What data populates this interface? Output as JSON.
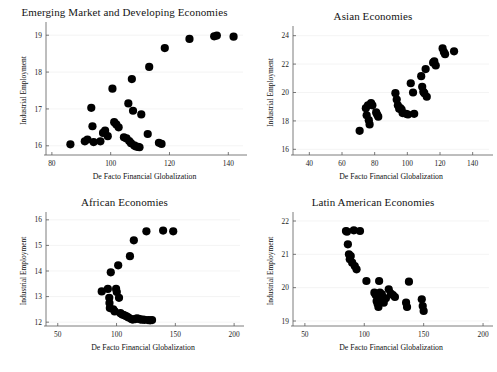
{
  "figure": {
    "background_color": "#ffffff",
    "marker_color": "#000000",
    "axis_color": "#5a5a5a",
    "panel_count": 4
  },
  "chart_data": [
    {
      "type": "scatter",
      "title": "Emerging Market and Developing Economies",
      "xlabel": "De Facto Financial Globalization",
      "ylabel": "Industrial Employment",
      "xlim": [
        78,
        145
      ],
      "ylim": [
        15.75,
        19.25
      ],
      "xticks": [
        80,
        100,
        120,
        140
      ],
      "yticks": [
        16,
        17,
        18,
        19
      ],
      "grid": false,
      "legend": "none",
      "points": [
        [
          86.3,
          16.04
        ],
        [
          91.2,
          16.12
        ],
        [
          92.1,
          16.17
        ],
        [
          93.4,
          17.03
        ],
        [
          93.8,
          16.53
        ],
        [
          94.2,
          16.1
        ],
        [
          96.5,
          16.12
        ],
        [
          97.4,
          16.35
        ],
        [
          98.1,
          16.41
        ],
        [
          99.0,
          16.26
        ],
        [
          100.6,
          17.55
        ],
        [
          101.2,
          16.64
        ],
        [
          101.9,
          16.58
        ],
        [
          102.7,
          16.5
        ],
        [
          104.5,
          16.23
        ],
        [
          105.4,
          16.2
        ],
        [
          106.0,
          17.15
        ],
        [
          106.3,
          16.13
        ],
        [
          106.9,
          16.07
        ],
        [
          107.2,
          17.81
        ],
        [
          107.6,
          16.95
        ],
        [
          108.0,
          16.01
        ],
        [
          108.6,
          15.98
        ],
        [
          109.3,
          15.97
        ],
        [
          109.8,
          15.96
        ],
        [
          110.4,
          16.85
        ],
        [
          112.6,
          16.32
        ],
        [
          113.1,
          18.14
        ],
        [
          116.4,
          16.08
        ],
        [
          117.3,
          16.05
        ],
        [
          118.4,
          18.65
        ],
        [
          126.8,
          18.9
        ],
        [
          135.2,
          18.97
        ],
        [
          136.1,
          18.99
        ],
        [
          141.8,
          18.96
        ]
      ]
    },
    {
      "type": "scatter",
      "title": "Asian Economies",
      "xlabel": "De Facto Financial Globalization",
      "ylabel": "Industrial Employment",
      "xlim": [
        30,
        150
      ],
      "ylim": [
        15.6,
        24.4
      ],
      "xticks": [
        40,
        60,
        80,
        100,
        120,
        140
      ],
      "yticks": [
        16,
        18,
        20,
        22,
        24
      ],
      "grid": false,
      "legend": "none",
      "points": [
        [
          70.8,
          17.3
        ],
        [
          74.6,
          18.9
        ],
        [
          75.1,
          18.4
        ],
        [
          75.9,
          19.1
        ],
        [
          76.4,
          18.05
        ],
        [
          76.9,
          17.75
        ],
        [
          77.8,
          19.25
        ],
        [
          78.6,
          19.1
        ],
        [
          80.9,
          18.6
        ],
        [
          81.5,
          18.45
        ],
        [
          82.2,
          18.3
        ],
        [
          92.7,
          19.95
        ],
        [
          93.5,
          19.5
        ],
        [
          94.2,
          19.1
        ],
        [
          95.0,
          18.85
        ],
        [
          95.7,
          18.9
        ],
        [
          96.5,
          18.8
        ],
        [
          97.1,
          18.55
        ],
        [
          99.2,
          18.5
        ],
        [
          100.4,
          18.45
        ],
        [
          102.1,
          20.65
        ],
        [
          103.5,
          20.0
        ],
        [
          104.2,
          18.5
        ],
        [
          108.5,
          21.15
        ],
        [
          109.1,
          20.4
        ],
        [
          109.8,
          20.05
        ],
        [
          110.4,
          19.95
        ],
        [
          111.2,
          21.65
        ],
        [
          111.9,
          19.7
        ],
        [
          115.8,
          22.1
        ],
        [
          116.5,
          22.2
        ],
        [
          117.4,
          21.9
        ],
        [
          121.6,
          23.1
        ],
        [
          122.4,
          22.85
        ],
        [
          123.1,
          22.7
        ],
        [
          128.6,
          22.9
        ]
      ]
    },
    {
      "type": "scatter",
      "title": "African Economies",
      "xlabel": "De Facto Financial Globalization",
      "ylabel": "Industrial Employment",
      "xlim": [
        40,
        205
      ],
      "ylim": [
        11.85,
        16.15
      ],
      "xticks": [
        50,
        100,
        150,
        200
      ],
      "yticks": [
        12,
        13,
        14,
        15,
        16
      ],
      "grid": false,
      "legend": "none",
      "points": [
        [
          87.4,
          13.2
        ],
        [
          92.6,
          13.3
        ],
        [
          93.8,
          12.95
        ],
        [
          94.0,
          12.75
        ],
        [
          94.3,
          12.55
        ],
        [
          95.1,
          13.95
        ],
        [
          97.2,
          12.5
        ],
        [
          98.4,
          12.42
        ],
        [
          99.6,
          13.3
        ],
        [
          100.2,
          13.18
        ],
        [
          101.4,
          14.22
        ],
        [
          102.1,
          12.95
        ],
        [
          103.3,
          12.35
        ],
        [
          104.8,
          12.3
        ],
        [
          106.2,
          12.28
        ],
        [
          107.5,
          12.25
        ],
        [
          108.8,
          12.22
        ],
        [
          110.2,
          12.18
        ],
        [
          111.4,
          14.58
        ],
        [
          112.6,
          12.12
        ],
        [
          113.8,
          12.1
        ],
        [
          114.7,
          15.2
        ],
        [
          116.0,
          12.12
        ],
        [
          117.3,
          12.15
        ],
        [
          118.9,
          12.13
        ],
        [
          120.5,
          12.1
        ],
        [
          122.2,
          12.1
        ],
        [
          123.8,
          12.09
        ],
        [
          125.4,
          15.55
        ],
        [
          126.8,
          12.08
        ],
        [
          128.5,
          12.07
        ],
        [
          130.2,
          12.08
        ],
        [
          139.6,
          15.58
        ],
        [
          148.2,
          15.55
        ]
      ]
    },
    {
      "type": "scatter",
      "title": "Latin American Economies",
      "xlabel": "De Facto Financial Globalization",
      "ylabel": "Industrial Employment",
      "xlim": [
        40,
        205
      ],
      "ylim": [
        18.85,
        22.15
      ],
      "xticks": [
        50,
        100,
        150,
        200
      ],
      "yticks": [
        19,
        20,
        21,
        22
      ],
      "grid": false,
      "legend": "none",
      "points": [
        [
          84.6,
          21.7
        ],
        [
          85.4,
          21.68
        ],
        [
          86.2,
          21.3
        ],
        [
          87.1,
          21.0
        ],
        [
          87.8,
          20.85
        ],
        [
          88.6,
          20.95
        ],
        [
          89.8,
          20.75
        ],
        [
          91.2,
          21.72
        ],
        [
          92.0,
          20.65
        ],
        [
          93.5,
          20.55
        ],
        [
          96.4,
          21.7
        ],
        [
          101.8,
          20.2
        ],
        [
          108.5,
          19.85
        ],
        [
          109.6,
          19.78
        ],
        [
          110.4,
          19.6
        ],
        [
          111.2,
          19.52
        ],
        [
          111.9,
          19.42
        ],
        [
          112.5,
          20.2
        ],
        [
          113.2,
          19.85
        ],
        [
          114.0,
          19.75
        ],
        [
          114.8,
          19.8
        ],
        [
          115.6,
          19.62
        ],
        [
          116.4,
          19.55
        ],
        [
          118.2,
          19.68
        ],
        [
          120.6,
          19.95
        ],
        [
          122.4,
          19.82
        ],
        [
          124.1,
          19.78
        ],
        [
          125.8,
          19.72
        ],
        [
          135.2,
          19.55
        ],
        [
          136.0,
          19.42
        ],
        [
          137.6,
          20.18
        ],
        [
          148.4,
          19.65
        ],
        [
          149.2,
          19.45
        ],
        [
          150.0,
          19.3
        ]
      ]
    }
  ]
}
